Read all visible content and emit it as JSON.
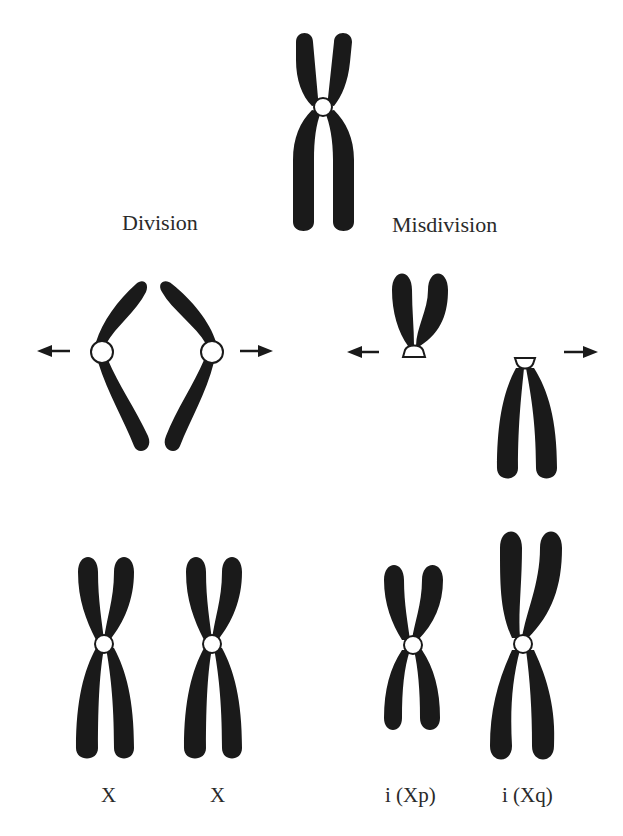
{
  "figure": {
    "headings": {
      "division": "Division",
      "misdivision": "Misdivision"
    },
    "bottom_labels": {
      "x1": "X",
      "x2": "X",
      "ixp": "i (Xp)",
      "ixq": "i (Xq)"
    },
    "elements": {
      "parent_chromosome": "metaphase X chromosome with centromere",
      "division_products": "two chromatids separating at normal centromere division",
      "misdivision_products": "transverse centromere split yielding short-arm and long-arm fragments",
      "arrows": [
        "left",
        "right",
        "left",
        "right"
      ]
    },
    "colors": {
      "chromosome": "#1a1a1a",
      "centromere": "#ffffff",
      "text": "#2a2a2a",
      "background": "#ffffff"
    }
  }
}
